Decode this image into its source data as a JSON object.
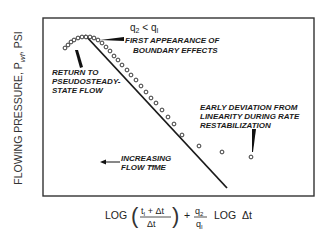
{
  "figure": {
    "y_axis_label": "FLOWING PRESSURE, P",
    "y_axis_subscript": "wf",
    "y_axis_unit": ", PSI",
    "x_axis_label": {
      "log1": "LOG",
      "num": "t",
      "num_sub": "I",
      "num_rest": " + Δt",
      "den": "Δt",
      "plus": "+",
      "q_num": "q",
      "q_num_sub": "2",
      "q_den": "q",
      "q_den_sub": "I",
      "log2": "LOG  Δt"
    },
    "condition": {
      "q_left": "q",
      "q_left_sub": "2",
      "op": " < ",
      "q_right": "q",
      "q_right_sub": "I"
    },
    "annotations": {
      "first_appearance": [
        "FIRST APPEARANCE OF",
        "BOUNDARY EFFECTS"
      ],
      "return_pseudo": [
        "RETURN TO",
        "PSEUDOSTEADY-",
        "STATE FLOW"
      ],
      "early_deviation": [
        "EARLY DEVIATION FROM",
        "LINEARITY DURING RATE",
        "RESTABILIZATION"
      ],
      "increasing_time": [
        "INCREASING",
        "FLOW TIME"
      ]
    }
  },
  "chart_data": {
    "type": "scatter",
    "title": "",
    "xlabel": "LOG((t1+Δt)/Δt) + (q2/q1) LOG Δt",
    "ylabel": "FLOWING PRESSURE, Pwf, PSI",
    "grid": false,
    "legend": null,
    "note": "Schematic, no numeric ticks; coordinates are pixel positions in the figure",
    "straight_line": {
      "x1": 85,
      "y1": 35,
      "x2": 227,
      "y2": 188
    },
    "points": [
      [
        65,
        48
      ],
      [
        68,
        45
      ],
      [
        71,
        42
      ],
      [
        74,
        40
      ],
      [
        78,
        38
      ],
      [
        82,
        37
      ],
      [
        86,
        37
      ],
      [
        90,
        37
      ],
      [
        94,
        38
      ],
      [
        98,
        40
      ],
      [
        102,
        43
      ],
      [
        106,
        47
      ],
      [
        110,
        51
      ],
      [
        114,
        56
      ],
      [
        118,
        60
      ],
      [
        122,
        65
      ],
      [
        127,
        70
      ],
      [
        131,
        75
      ],
      [
        136,
        80
      ],
      [
        141,
        86
      ],
      [
        146,
        92
      ],
      [
        151,
        98
      ],
      [
        156,
        103
      ],
      [
        162,
        110
      ],
      [
        168,
        117
      ],
      [
        174,
        124
      ],
      [
        182,
        135
      ],
      [
        199,
        146
      ],
      [
        222,
        152
      ],
      [
        251,
        157
      ]
    ],
    "annotations": [
      "q2 < q1",
      "FIRST APPEARANCE OF BOUNDARY EFFECTS",
      "RETURN TO PSEUDOSTEADY-STATE FLOW",
      "EARLY DEVIATION FROM LINEARITY DURING RATE RESTABILIZATION",
      "INCREASING FLOW TIME"
    ]
  }
}
